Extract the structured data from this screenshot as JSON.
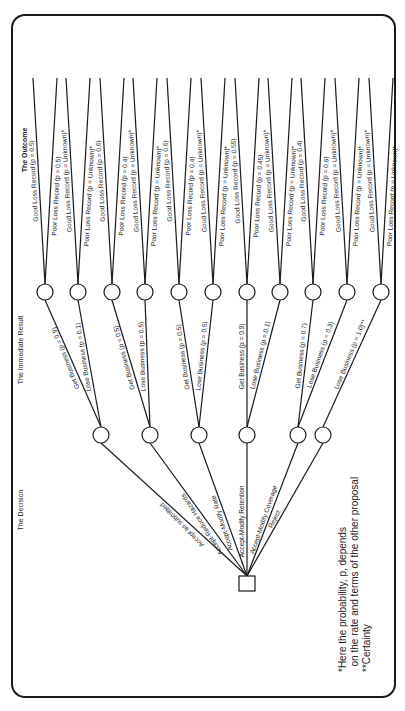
{
  "headers": {
    "decision": "The Decision",
    "immediate_result": "The Immediate Result",
    "outcome": "The Outcome"
  },
  "decisions": [
    "Accept as submitted",
    "Accept-Reduce Hazards",
    "Accept-Modify Rate",
    "Accept-Modify Retention",
    "Accept-Modify Coverage",
    "Reject"
  ],
  "results": [
    "Get Business (p = 0.9)",
    "Lose Business (p = 0.1)",
    "Get Business (p = 0.5)",
    "Lose Business (p = 0.5)",
    "Get Business (p = 0.5)",
    "Lose Business (p = 0.5)",
    "Get Business (p = 0.9)",
    "Lose Business (p = 0.1)",
    "Get Business (p = 0.7)",
    "Lose Business (p = 0.3)",
    "Lose Business (p = 1.0)**"
  ],
  "outcomes": [
    [
      "Good Loss Record (p = 0.5)",
      "Poor Loss Record (p = 0.5)"
    ],
    [
      "Good Loss Record (p = Unknown)*",
      "Poor Loss Record (p = Unknown)*"
    ],
    [
      "Good Loss Record (p = 0.6)",
      "Poor Loss Record (p = 0.4)"
    ],
    [
      "Good Loss Record (p = Unknown)*",
      "Poor Loss Record (p = Unknown)*"
    ],
    [
      "Good Loss Record (p = 0.6)",
      "Poor Loss Record (p = 0.4)"
    ],
    [
      "Good Loss Record (p = Unknown)*",
      "Poor Loss Record (p = Unknown)*"
    ],
    [
      "Good Loss Record (p = 0.55)",
      "Poor Loss Record (p = 0.45)"
    ],
    [
      "Good Loss Record (p = Unknown)*",
      "Poor Loss Record (p = Unknown)*"
    ],
    [
      "Good Loss Record (p = 0.4)",
      "Poor Loss Record (p = 0.6)"
    ],
    [
      "Good Loss Record (p = Unknown)*",
      "Poor Loss Record (p = Unknown)*"
    ],
    [
      "Good Loss Record (p = Unknown)*",
      "Poor Loss Record (p = Unknown)*"
    ]
  ],
  "footnotes": {
    "line1": "*Here the probability, p, depends",
    "line2": "  on the rate and terms of the other proposal",
    "line3": "**Certainty"
  }
}
